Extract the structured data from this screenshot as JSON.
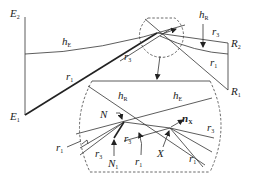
{
  "figure": {
    "labels": {
      "E2": {
        "main": "E",
        "sub": "2"
      },
      "E1": {
        "main": "E",
        "sub": "1"
      },
      "R2": {
        "main": "R",
        "sub": "2"
      },
      "R1": {
        "main": "R",
        "sub": "1"
      },
      "hE_top": {
        "main": "h",
        "sub": "E"
      },
      "hR_top": {
        "main": "h",
        "sub": "R"
      },
      "r1_top_left": {
        "main": "r",
        "sub": "1"
      },
      "r3_top_mid": {
        "main": "r",
        "sub": "3"
      },
      "r3_top_right": {
        "main": "r",
        "sub": "3"
      },
      "r1_top_right": {
        "main": "r",
        "sub": "1"
      },
      "hR_inset": {
        "main": "h",
        "sub": "R"
      },
      "hE_inset": {
        "main": "h",
        "sub": "E"
      },
      "N_inset": {
        "main": "N",
        "sub": ""
      },
      "N1_inset": {
        "main": "N",
        "sub": "1"
      },
      "nX_inset": {
        "main": "n",
        "sub": "X"
      },
      "X_inset": {
        "main": "X",
        "sub": ""
      },
      "r1_inset_left": {
        "main": "r",
        "sub": "1"
      },
      "r3_inset_left": {
        "main": "r",
        "sub": "3"
      },
      "r3_inset_mid": {
        "main": "r",
        "sub": "3"
      },
      "r1_inset_mid": {
        "main": "r",
        "sub": "1"
      },
      "r3_inset_right": {
        "main": "r",
        "sub": "3"
      },
      "r1_inset_right": {
        "main": "r",
        "sub": "1"
      }
    },
    "colors": {
      "stroke": "#333333",
      "background": "#ffffff"
    }
  }
}
